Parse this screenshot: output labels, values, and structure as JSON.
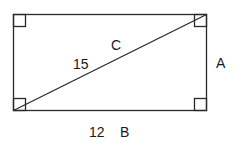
{
  "diagram": {
    "shape": "rectangle",
    "rectangle": {
      "x": 13.5,
      "y": 14.5,
      "width": 193,
      "height": 96
    },
    "stroke_color": "#2a2a2a",
    "diagonal": {
      "from": "bottom-left",
      "to": "top-right"
    },
    "right_angle_marks": [
      "top-left",
      "top-right",
      "bottom-left",
      "bottom-right"
    ],
    "labels": {
      "diagonal_length": "15",
      "diagonal_name": "C",
      "side_right_name": "A",
      "bottom_length": "12",
      "bottom_name": "B"
    }
  }
}
